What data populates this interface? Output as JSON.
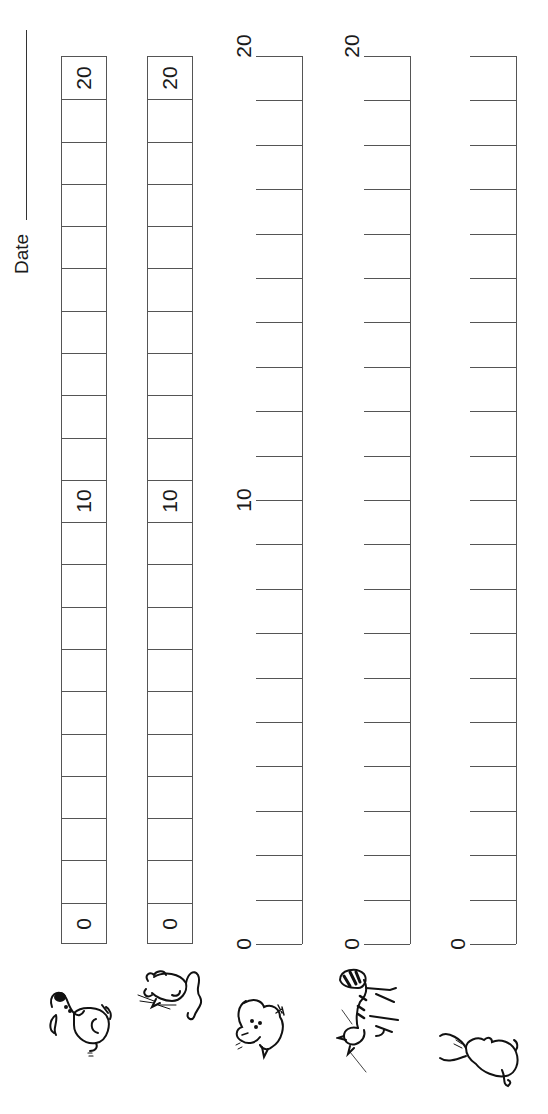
{
  "header": {
    "date_label": "Date"
  },
  "scale": {
    "min": 0,
    "max": 20,
    "step": 1
  },
  "graphs": [
    {
      "kind": "boxes",
      "animal": "dog",
      "labels": {
        "0": "0",
        "10": "10",
        "20": "20"
      }
    },
    {
      "kind": "boxes",
      "animal": "mouse",
      "labels": {
        "0": "0",
        "10": "10",
        "20": "20"
      }
    },
    {
      "kind": "ticks",
      "animal": "bird",
      "labels": {
        "0": "0",
        "10": "10",
        "20": "20"
      }
    },
    {
      "kind": "ticks",
      "animal": "cat",
      "labels": {
        "0": "0",
        "20": "20"
      }
    },
    {
      "kind": "ticks",
      "animal": "rabbit",
      "labels": {
        "0": "0"
      }
    }
  ],
  "icons": {
    "dog": "dog-icon",
    "mouse": "mouse-icon",
    "bird": "bird-icon",
    "cat": "cat-icon",
    "rabbit": "rabbit-icon"
  }
}
